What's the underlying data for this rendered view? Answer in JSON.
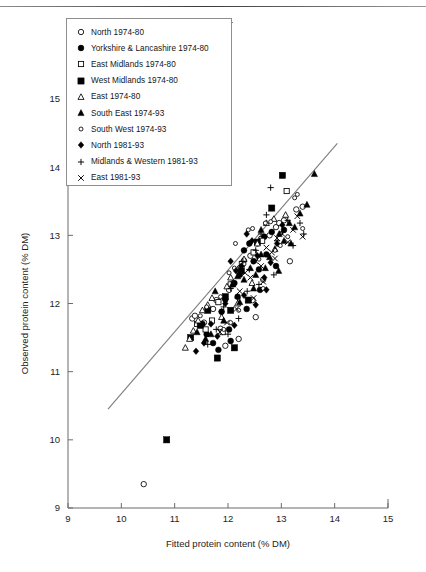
{
  "chart_data": {
    "type": "scatter",
    "title": "",
    "xlabel": "Fitted protein content (% DM)",
    "ylabel": "Observed protein content (% DM)",
    "xlim": [
      9,
      15
    ],
    "ylim": [
      9,
      15
    ],
    "xticks": [
      9,
      10,
      11,
      12,
      13,
      14,
      15
    ],
    "yticks": [
      9,
      10,
      11,
      12,
      13,
      14,
      15
    ],
    "grid": false,
    "legend_position": "top-left-inside",
    "reference_line": {
      "name": "fitted-regression-line",
      "x": [
        9.75,
        14.05
      ],
      "y": [
        10.45,
        14.35
      ]
    },
    "series": [
      {
        "name": "North 1974-80",
        "marker": "open-circle",
        "points": [
          [
            10.42,
            9.35
          ],
          [
            11.33,
            11.78
          ],
          [
            11.38,
            11.82
          ],
          [
            11.55,
            11.72
          ],
          [
            11.72,
            11.92
          ],
          [
            11.78,
            12.05
          ],
          [
            11.86,
            11.63
          ],
          [
            12.02,
            12.2
          ],
          [
            12.1,
            12.3
          ],
          [
            12.22,
            12.52
          ],
          [
            12.3,
            12.63
          ],
          [
            12.42,
            12.7
          ],
          [
            12.55,
            12.88
          ],
          [
            12.62,
            12.95
          ],
          [
            12.78,
            13.0
          ],
          [
            12.9,
            13.12
          ],
          [
            12.96,
            13.18
          ],
          [
            13.05,
            13.22
          ],
          [
            13.16,
            12.62
          ],
          [
            13.28,
            13.38
          ],
          [
            12.46,
            12.05
          ],
          [
            12.52,
            11.8
          ],
          [
            11.95,
            11.38
          ],
          [
            12.2,
            11.48
          ],
          [
            13.4,
            13.42
          ],
          [
            12.66,
            12.35
          ]
        ]
      },
      {
        "name": "Yorkshire & Lancashire 1974-80",
        "marker": "filled-circle",
        "points": [
          [
            11.52,
            11.7
          ],
          [
            11.6,
            11.55
          ],
          [
            11.72,
            11.42
          ],
          [
            11.88,
            11.88
          ],
          [
            11.95,
            12.06
          ],
          [
            12.02,
            11.62
          ],
          [
            12.12,
            12.3
          ],
          [
            12.22,
            12.42
          ],
          [
            12.3,
            12.78
          ],
          [
            12.4,
            12.88
          ],
          [
            12.48,
            12.62
          ],
          [
            12.58,
            12.5
          ],
          [
            12.68,
            12.98
          ],
          [
            12.82,
            13.05
          ],
          [
            12.18,
            12.1
          ],
          [
            11.82,
            11.32
          ],
          [
            12.6,
            12.2
          ],
          [
            12.35,
            11.92
          ],
          [
            12.9,
            12.55
          ],
          [
            12.05,
            11.45
          ],
          [
            13.05,
            13.08
          ],
          [
            12.72,
            12.72
          ]
        ]
      },
      {
        "name": "East Midlands 1974-80",
        "marker": "open-square",
        "points": [
          [
            11.42,
            11.7
          ],
          [
            11.58,
            11.62
          ],
          [
            11.7,
            11.75
          ],
          [
            11.82,
            12.02
          ],
          [
            12.05,
            12.28
          ],
          [
            12.26,
            12.58
          ],
          [
            12.48,
            12.75
          ],
          [
            13.1,
            13.65
          ],
          [
            11.9,
            11.58
          ],
          [
            12.64,
            12.92
          ]
        ]
      },
      {
        "name": "West Midlands 1974-80",
        "marker": "filled-square",
        "points": [
          [
            10.85,
            10.0
          ],
          [
            11.48,
            11.68
          ],
          [
            11.62,
            11.9
          ],
          [
            11.8,
            11.2
          ],
          [
            11.95,
            12.1
          ],
          [
            12.05,
            11.9
          ],
          [
            12.12,
            11.35
          ],
          [
            12.25,
            12.48
          ],
          [
            12.55,
            12.9
          ],
          [
            12.82,
            13.4
          ],
          [
            13.02,
            13.88
          ],
          [
            11.3,
            11.5
          ],
          [
            12.38,
            12.05
          ]
        ]
      },
      {
        "name": "East 1974-80",
        "marker": "open-triangle",
        "points": [
          [
            11.2,
            11.35
          ],
          [
            11.28,
            11.48
          ],
          [
            11.35,
            11.6
          ],
          [
            11.44,
            11.75
          ],
          [
            11.52,
            11.9
          ],
          [
            11.62,
            11.98
          ],
          [
            11.7,
            12.08
          ],
          [
            11.88,
            11.8
          ],
          [
            12.05,
            12.38
          ],
          [
            12.3,
            12.65
          ],
          [
            12.55,
            12.88
          ],
          [
            12.72,
            13.18
          ],
          [
            12.86,
            13.24
          ],
          [
            13.08,
            13.3
          ],
          [
            11.98,
            12.25
          ],
          [
            12.18,
            12.0
          ],
          [
            12.45,
            12.3
          ]
        ]
      },
      {
        "name": "South East 1974-93",
        "marker": "filled-triangle",
        "points": [
          [
            11.42,
            11.58
          ],
          [
            11.58,
            11.48
          ],
          [
            11.76,
            12.18
          ],
          [
            11.92,
            11.75
          ],
          [
            12.08,
            12.28
          ],
          [
            12.18,
            12.4
          ],
          [
            12.3,
            12.35
          ],
          [
            12.42,
            12.52
          ],
          [
            12.52,
            12.42
          ],
          [
            12.62,
            12.72
          ],
          [
            12.7,
            12.52
          ],
          [
            12.78,
            12.68
          ],
          [
            12.88,
            12.8
          ],
          [
            12.96,
            13.02
          ],
          [
            13.05,
            12.92
          ],
          [
            13.15,
            13.18
          ],
          [
            13.25,
            13.12
          ],
          [
            13.35,
            13.32
          ],
          [
            13.48,
            13.45
          ],
          [
            13.62,
            13.9
          ],
          [
            12.22,
            12.02
          ],
          [
            12.48,
            12.22
          ],
          [
            12.95,
            12.48
          ],
          [
            13.18,
            12.88
          ],
          [
            11.68,
            11.55
          ],
          [
            12.62,
            13.08
          ]
        ]
      },
      {
        "name": "South West 1974-93",
        "marker": "small-open-circle",
        "points": [
          [
            11.48,
            11.82
          ],
          [
            11.6,
            11.95
          ],
          [
            11.86,
            12.1
          ],
          [
            12.02,
            12.45
          ],
          [
            12.12,
            12.52
          ],
          [
            12.3,
            12.58
          ],
          [
            12.38,
            13.08
          ],
          [
            12.46,
            13.1
          ],
          [
            12.58,
            12.65
          ],
          [
            12.7,
            13.18
          ],
          [
            12.8,
            13.2
          ],
          [
            12.88,
            12.78
          ],
          [
            12.98,
            12.85
          ],
          [
            13.12,
            12.98
          ],
          [
            13.25,
            13.55
          ],
          [
            13.3,
            13.6
          ],
          [
            12.2,
            11.9
          ],
          [
            12.05,
            11.72
          ],
          [
            11.92,
            11.62
          ],
          [
            13.4,
            13.1
          ],
          [
            12.66,
            12.22
          ],
          [
            12.14,
            12.88
          ]
        ]
      },
      {
        "name": "North 1981-93",
        "marker": "filled-diamond",
        "points": [
          [
            11.4,
            11.3
          ],
          [
            11.55,
            11.42
          ],
          [
            11.68,
            11.7
          ],
          [
            11.8,
            11.52
          ],
          [
            11.95,
            12.0
          ],
          [
            12.05,
            12.62
          ],
          [
            12.15,
            12.48
          ],
          [
            12.25,
            12.55
          ],
          [
            12.35,
            13.02
          ],
          [
            12.45,
            12.92
          ],
          [
            12.55,
            12.7
          ],
          [
            12.68,
            12.38
          ],
          [
            12.8,
            12.6
          ],
          [
            12.92,
            12.88
          ],
          [
            12.3,
            12.12
          ],
          [
            12.52,
            11.98
          ],
          [
            11.88,
            11.88
          ],
          [
            13.02,
            13.15
          ],
          [
            12.12,
            11.68
          ],
          [
            12.72,
            12.2
          ]
        ]
      },
      {
        "name": "Midlands & Western 1981-93",
        "marker": "plus",
        "points": [
          [
            11.62,
            11.4
          ],
          [
            11.78,
            11.62
          ],
          [
            11.92,
            11.95
          ],
          [
            12.05,
            12.22
          ],
          [
            12.18,
            12.08
          ],
          [
            12.28,
            12.62
          ],
          [
            12.4,
            12.5
          ],
          [
            12.52,
            12.78
          ],
          [
            12.62,
            13.02
          ],
          [
            12.72,
            13.3
          ],
          [
            12.8,
            13.7
          ],
          [
            12.92,
            12.92
          ],
          [
            13.02,
            13.05
          ],
          [
            13.12,
            13.22
          ],
          [
            13.22,
            12.85
          ],
          [
            13.35,
            13.18
          ],
          [
            12.36,
            12.18
          ],
          [
            12.2,
            11.78
          ],
          [
            12.0,
            11.55
          ],
          [
            13.42,
            13.02
          ],
          [
            12.86,
            12.42
          ],
          [
            12.58,
            12.28
          ]
        ]
      },
      {
        "name": "East 1981-93",
        "marker": "cross",
        "points": [
          [
            11.85,
            11.58
          ],
          [
            11.98,
            11.72
          ],
          [
            12.1,
            12.28
          ],
          [
            12.22,
            12.18
          ],
          [
            12.32,
            12.45
          ],
          [
            12.42,
            12.38
          ],
          [
            12.52,
            12.62
          ],
          [
            12.62,
            12.55
          ],
          [
            12.72,
            12.82
          ],
          [
            12.82,
            12.75
          ],
          [
            12.92,
            12.96
          ],
          [
            13.02,
            13.02
          ],
          [
            13.12,
            12.9
          ],
          [
            13.22,
            13.08
          ],
          [
            13.3,
            13.28
          ],
          [
            12.48,
            12.08
          ],
          [
            12.66,
            12.32
          ],
          [
            12.16,
            11.92
          ],
          [
            13.4,
            12.98
          ],
          [
            12.88,
            12.66
          ]
        ]
      }
    ]
  },
  "axes": {
    "x_title": "Fitted protein content (% DM)",
    "y_title": "Observed protein content (% DM)",
    "x_tick_labels": [
      "9",
      "10",
      "11",
      "12",
      "13",
      "14",
      "15"
    ],
    "y_tick_labels": [
      "9",
      "10",
      "11",
      "12",
      "13",
      "14",
      "15"
    ]
  },
  "legend": {
    "items": [
      {
        "glyph": "open-circle",
        "label": "North 1974-80"
      },
      {
        "glyph": "filled-circle",
        "label": "Yorkshire & Lancashire 1974-80"
      },
      {
        "glyph": "open-square",
        "label": "East Midlands 1974-80"
      },
      {
        "glyph": "filled-square",
        "label": "West Midlands 1974-80"
      },
      {
        "glyph": "open-triangle",
        "label": "East 1974-80"
      },
      {
        "glyph": "filled-triangle",
        "label": "South East 1974-93"
      },
      {
        "glyph": "small-open-circle",
        "label": "South West 1974-93"
      },
      {
        "glyph": "filled-diamond",
        "label": "North 1981-93"
      },
      {
        "glyph": "plus",
        "label": "Midlands & Western 1981-93"
      },
      {
        "glyph": "cross",
        "label": "East 1981-93"
      }
    ]
  },
  "colors": {
    "marker": "#000000",
    "axis": "#6b6b6b",
    "fit_line": "#7d7d7d",
    "background": "#ffffff"
  }
}
